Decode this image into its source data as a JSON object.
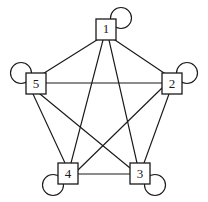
{
  "figure": {
    "name": "complete-graph-with-self-loops",
    "width": 208,
    "height": 202,
    "background_color": "#ffffff",
    "stroke_color": "#1a1a1a",
    "node_fill_color": "#ffffff"
  },
  "graph_data": {
    "type": "diagram",
    "graph_type": "undirected complete graph with self-loops",
    "node_count": 5,
    "edge_count": 10,
    "loop_count": 5,
    "layout": "pentagon",
    "nodes": [
      {
        "id": "1",
        "label": "1",
        "cx": 106,
        "cy": 29,
        "box_x": 96,
        "box_y": 19,
        "box_w": 20,
        "box_h": 21,
        "loop": {
          "present": true,
          "position": "top-right",
          "cx": 121,
          "cy": 18,
          "r": 10.5
        }
      },
      {
        "id": "2",
        "label": "2",
        "cx": 172,
        "cy": 84,
        "box_x": 162,
        "box_y": 73,
        "box_w": 20,
        "box_h": 21,
        "loop": {
          "present": true,
          "position": "top-right",
          "cx": 187,
          "cy": 73,
          "r": 10.5
        }
      },
      {
        "id": "3",
        "label": "3",
        "cx": 140,
        "cy": 174,
        "box_x": 130,
        "box_y": 163,
        "box_w": 20,
        "box_h": 21,
        "loop": {
          "present": true,
          "position": "bottom-right",
          "cx": 155,
          "cy": 185,
          "r": 10.5
        }
      },
      {
        "id": "4",
        "label": "4",
        "cx": 68,
        "cy": 174,
        "box_x": 58,
        "box_y": 163,
        "box_w": 20,
        "box_h": 21,
        "loop": {
          "present": true,
          "position": "bottom-left",
          "cx": 53,
          "cy": 185,
          "r": 10.5
        }
      },
      {
        "id": "5",
        "label": "5",
        "cx": 36,
        "cy": 84,
        "box_x": 26,
        "box_y": 73,
        "box_w": 20,
        "box_h": 21,
        "loop": {
          "present": true,
          "position": "top-left",
          "cx": 21,
          "cy": 73,
          "r": 10.5
        }
      }
    ],
    "edges": [
      {
        "from": "1",
        "to": "2",
        "x1": 112,
        "y1": 38,
        "x2": 167,
        "y2": 75
      },
      {
        "from": "1",
        "to": "3",
        "x1": 109,
        "y1": 40,
        "x2": 137,
        "y2": 163
      },
      {
        "from": "1",
        "to": "4",
        "x1": 103,
        "y1": 40,
        "x2": 71,
        "y2": 163
      },
      {
        "from": "1",
        "to": "5",
        "x1": 100,
        "y1": 38,
        "x2": 41,
        "y2": 75
      },
      {
        "from": "2",
        "to": "3",
        "x1": 169,
        "y1": 94,
        "x2": 144,
        "y2": 163
      },
      {
        "from": "2",
        "to": "4",
        "x1": 162,
        "y1": 88,
        "x2": 78,
        "y2": 170
      },
      {
        "from": "2",
        "to": "5",
        "x1": 162,
        "y1": 83,
        "x2": 46,
        "y2": 83
      },
      {
        "from": "3",
        "to": "4",
        "x1": 130,
        "y1": 174,
        "x2": 78,
        "y2": 174
      },
      {
        "from": "3",
        "to": "5",
        "x1": 130,
        "y1": 168,
        "x2": 40,
        "y2": 94
      },
      {
        "from": "4",
        "to": "5",
        "x1": 65,
        "y1": 163,
        "x2": 33,
        "y2": 94
      }
    ]
  }
}
